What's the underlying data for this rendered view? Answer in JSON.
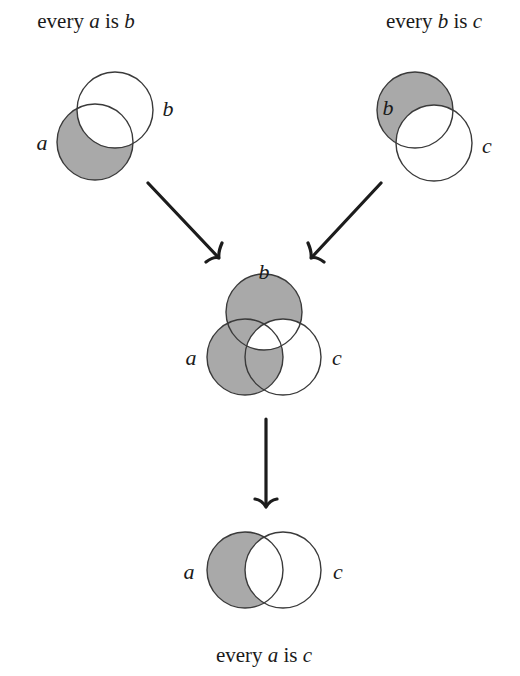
{
  "premises": [
    {
      "id": "premise-1",
      "caption": {
        "prefix": "every ",
        "var1": "a",
        "mid": " is ",
        "var2": "b"
      },
      "labels": {
        "left": "a",
        "right": "b"
      },
      "shaded_region": "a minus b"
    },
    {
      "id": "premise-2",
      "caption": {
        "prefix": "every ",
        "var1": "b",
        "mid": " is ",
        "var2": "c"
      },
      "labels": {
        "left": "b",
        "right": "c"
      },
      "shaded_region": "b minus c"
    }
  ],
  "combined": {
    "labels": {
      "top": "b",
      "left": "a",
      "right": "c"
    },
    "shaded_regions": [
      "a minus b",
      "b minus c"
    ]
  },
  "conclusion": {
    "caption": {
      "prefix": "every ",
      "var1": "a",
      "mid": " is ",
      "var2": "c"
    },
    "labels": {
      "left": "a",
      "right": "c"
    },
    "shaded_region": "a minus c"
  },
  "colors": {
    "shade": "#a9a9a9",
    "stroke": "#3a3a3a",
    "arrow": "#1c1c1c",
    "background": "#ffffff"
  }
}
